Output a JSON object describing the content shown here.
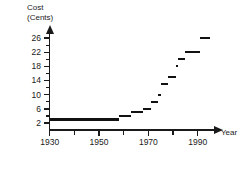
{
  "chart_data": {
    "type": "line",
    "subtype": "step",
    "title": "",
    "ylabel": "Cost\n(Cents)",
    "xlabel": "Year",
    "ylim": [
      0,
      28
    ],
    "xlim": [
      1930,
      1997
    ],
    "grid": false,
    "legend": null,
    "y_ticks_major": [
      2,
      6,
      10,
      14,
      18,
      22,
      26
    ],
    "y_ticks_minor": [
      4,
      8,
      12,
      16,
      20,
      24
    ],
    "x_ticks_major": [
      1930,
      1950,
      1970,
      1990
    ],
    "x_ticks_minor": [
      1940,
      1960,
      1980
    ],
    "series": [
      {
        "name": "Cost of first-class postage",
        "steps": [
          {
            "x_start": 1930,
            "x_end": 1958,
            "y": 3
          },
          {
            "x_start": 1958,
            "x_end": 1963,
            "y": 4
          },
          {
            "x_start": 1963,
            "x_end": 1968,
            "y": 5
          },
          {
            "x_start": 1968,
            "x_end": 1971,
            "y": 6
          },
          {
            "x_start": 1971,
            "x_end": 1974,
            "y": 8
          },
          {
            "x_start": 1974,
            "x_end": 1975,
            "y": 10
          },
          {
            "x_start": 1975,
            "x_end": 1978,
            "y": 13
          },
          {
            "x_start": 1978,
            "x_end": 1981,
            "y": 15
          },
          {
            "x_start": 1981,
            "x_end": 1982,
            "y": 18
          },
          {
            "x_start": 1982,
            "x_end": 1985,
            "y": 20
          },
          {
            "x_start": 1985,
            "x_end": 1991,
            "y": 22
          },
          {
            "x_start": 1991,
            "x_end": 1995,
            "y": 26
          }
        ]
      }
    ]
  }
}
